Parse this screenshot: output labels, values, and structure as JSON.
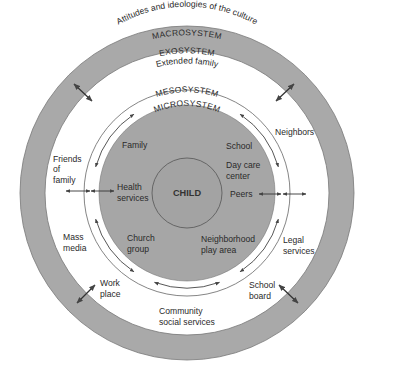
{
  "diagram": {
    "colors": {
      "ring_gray": "#a9a9a9",
      "micro_gray": "#a6a6a6",
      "child_gray": "#a3a3a3",
      "line": "#555555",
      "background": "#ffffff",
      "text": "#2a2a2a"
    },
    "geometry": {
      "cx": 187,
      "cy": 193,
      "macro_outer_r": 167,
      "macro_inner_r": 142,
      "meso_outer_r": 103,
      "meso_arrow_r": 95,
      "micro_r": 88,
      "child_r": 35
    },
    "macrosystem": {
      "title": "MACROSYSTEM",
      "subtitle": "Attitudes and ideologies of the culture"
    },
    "exosystem": {
      "title": "EXOSYSTEM",
      "items": [
        {
          "id": "extended-family",
          "lines": [
            "Extended family"
          ]
        },
        {
          "id": "neighbors",
          "lines": [
            "Neighbors"
          ]
        },
        {
          "id": "friends-of-family",
          "lines": [
            "Friends",
            "of",
            "family"
          ]
        },
        {
          "id": "mass-media",
          "lines": [
            "Mass",
            "media"
          ]
        },
        {
          "id": "legal-services",
          "lines": [
            "Legal",
            "services"
          ]
        },
        {
          "id": "work-place",
          "lines": [
            "Work",
            "place"
          ]
        },
        {
          "id": "school-board",
          "lines": [
            "School",
            "board"
          ]
        },
        {
          "id": "community-social-services",
          "lines": [
            "Community",
            "social services"
          ]
        }
      ]
    },
    "mesosystem": {
      "title": "MESOSYSTEM"
    },
    "microsystem": {
      "title": "MICROSYSTEM",
      "items": [
        {
          "id": "family",
          "lines": [
            "Family"
          ]
        },
        {
          "id": "school",
          "lines": [
            "School"
          ]
        },
        {
          "id": "day-care-center",
          "lines": [
            "Day care",
            "center"
          ]
        },
        {
          "id": "health-services",
          "lines": [
            "Health",
            "services"
          ]
        },
        {
          "id": "peers",
          "lines": [
            "Peers"
          ]
        },
        {
          "id": "church-group",
          "lines": [
            "Church",
            "group"
          ]
        },
        {
          "id": "neighborhood-play-area",
          "lines": [
            "Neighborhood",
            "play area"
          ]
        }
      ]
    },
    "center": {
      "label": "CHILD"
    },
    "arrows": {
      "meso_arcs_deg": [
        [
          196,
          236
        ],
        [
          304,
          344
        ],
        [
          16,
          56
        ],
        [
          124,
          164
        ],
        [
          70,
          110
        ]
      ],
      "diagonal": [
        {
          "x1": 74,
          "y1": 84,
          "x2": 92,
          "y2": 101
        },
        {
          "x1": 276,
          "y1": 101,
          "x2": 294,
          "y2": 84
        },
        {
          "x1": 77,
          "y1": 303,
          "x2": 95,
          "y2": 285
        },
        {
          "x1": 279,
          "y1": 285,
          "x2": 298,
          "y2": 303
        }
      ],
      "horizontal": [
        {
          "x1": 66,
          "y1": 191,
          "x2": 90,
          "y2": 191
        },
        {
          "x1": 91,
          "y1": 191,
          "x2": 114,
          "y2": 191
        },
        {
          "x1": 259,
          "y1": 194,
          "x2": 281,
          "y2": 194
        },
        {
          "x1": 283,
          "y1": 194,
          "x2": 306,
          "y2": 194
        }
      ]
    }
  }
}
